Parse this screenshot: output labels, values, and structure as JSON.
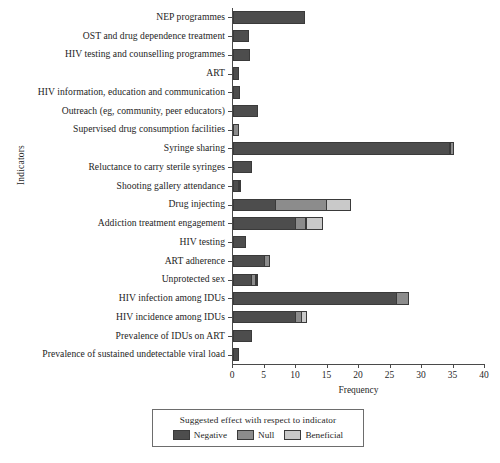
{
  "chart_data": {
    "type": "bar",
    "orientation": "horizontal",
    "stacked": true,
    "title": "",
    "xlabel": "Frequency",
    "ylabel": "Indicators",
    "xlim": [
      0,
      40
    ],
    "xticks": [
      0,
      5,
      10,
      15,
      20,
      25,
      30,
      35,
      40
    ],
    "grid": false,
    "legend_title": "Suggested effect with respect to indicator",
    "legend_position": "bottom",
    "series": [
      {
        "name": "Negative",
        "color": "#4d4d4d",
        "values": [
          11.5,
          2.5,
          2.7,
          1.0,
          1.1,
          4.0,
          0.0,
          34.5,
          3.0,
          1.0,
          6.8,
          10.0,
          2.0,
          5.0,
          3.0,
          26.0,
          10.0,
          3.0,
          1.0
        ]
      },
      {
        "name": "Null",
        "color": "#8c8c8c",
        "values": [
          0.0,
          0.0,
          0.0,
          0.0,
          0.0,
          0.0,
          1.0,
          0.7,
          0.0,
          0.2,
          8.2,
          1.7,
          0.0,
          1.0,
          0.8,
          2.0,
          1.0,
          0.0,
          0.0
        ]
      },
      {
        "name": "Beneficial",
        "color": "#c9c9c9",
        "values": [
          0.0,
          0.0,
          0.0,
          0.0,
          0.0,
          0.0,
          0.0,
          0.0,
          0.0,
          0.0,
          4.0,
          2.8,
          0.0,
          0.0,
          0.4,
          0.0,
          1.0,
          0.0,
          0.0
        ]
      }
    ],
    "categories": [
      "NEP programmes",
      "OST and drug dependence treatment",
      "HIV testing and counselling programmes",
      "ART",
      "HIV information, education and communication",
      "Outreach (eg, community, peer educators)",
      "Supervised drug consumption facilities",
      "Syringe sharing",
      "Reluctance to carry sterile syringes",
      "Shooting gallery attendance",
      "Drug injecting",
      "Addiction treatment engagement",
      "HIV testing",
      "ART adherence",
      "Unprotected sex",
      "HIV infection among IDUs",
      "HIV incidence among IDUs",
      "Prevalence of IDUs on ART",
      "Prevalence of sustained undetectable viral load"
    ]
  }
}
